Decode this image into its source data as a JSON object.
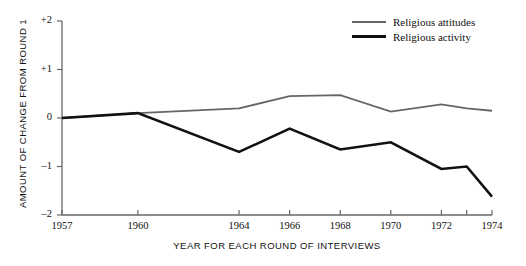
{
  "chart_data": {
    "type": "line",
    "title": "",
    "xlabel": "YEAR FOR EACH ROUND OF INTERVIEWS",
    "ylabel": "AMOUNT OF CHANGE FROM ROUND 1",
    "x": [
      1957,
      1960,
      1964,
      1966,
      1968,
      1970,
      1972,
      1973,
      1974
    ],
    "xlim": [
      1957,
      1974
    ],
    "ylim": [
      -2,
      2
    ],
    "grid": false,
    "legend_position": "top-right",
    "xticks": [
      {
        "value": 1957,
        "label": "1957"
      },
      {
        "value": 1960,
        "label": "1960"
      },
      {
        "value": 1964,
        "label": "1964"
      },
      {
        "value": 1966,
        "label": "1966"
      },
      {
        "value": 1968,
        "label": "1968"
      },
      {
        "value": 1970,
        "label": "1970"
      },
      {
        "value": 1972,
        "label": "1972"
      },
      {
        "value": 1973,
        "label": ""
      },
      {
        "value": 1974,
        "label": "1974"
      }
    ],
    "yticks": [
      {
        "value": 2,
        "label": "+2"
      },
      {
        "value": 1,
        "label": "+1"
      },
      {
        "value": 0,
        "label": "0"
      },
      {
        "value": -1,
        "label": "–1"
      },
      {
        "value": -2,
        "label": "–2"
      }
    ],
    "series": [
      {
        "name": "Religious attitudes",
        "color": "#666666",
        "width": 1.8,
        "values": [
          0,
          0.1,
          0.2,
          0.45,
          0.47,
          0.13,
          0.28,
          0.2,
          0.15
        ]
      },
      {
        "name": "Religious activity",
        "color": "#111111",
        "width": 2.6,
        "values": [
          0,
          0.1,
          -0.7,
          -0.22,
          -0.65,
          -0.5,
          -1.05,
          -1.0,
          -1.62
        ]
      }
    ]
  },
  "legend": {
    "items": [
      {
        "label": "Religious attitudes"
      },
      {
        "label": "Religious activity"
      }
    ]
  },
  "axes": {
    "y_title": "AMOUNT OF CHANGE FROM ROUND 1",
    "x_title": "YEAR FOR EACH ROUND OF INTERVIEWS"
  },
  "colors": {
    "attitudes_line": "#666666",
    "activity_line": "#111111",
    "axis": "#555555",
    "background": "#ffffff"
  }
}
